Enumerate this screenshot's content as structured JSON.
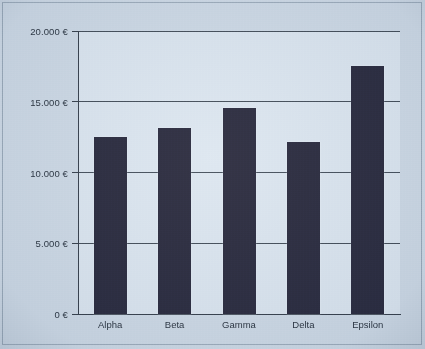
{
  "chart_data": {
    "type": "bar",
    "title": "",
    "xlabel": "",
    "ylabel": "",
    "categories": [
      "Alpha",
      "Beta",
      "Gamma",
      "Delta",
      "Epsilon"
    ],
    "values": [
      12500,
      13150,
      14550,
      12150,
      17550
    ],
    "ylim": [
      0,
      20000
    ],
    "ytick_values": [
      0,
      5000,
      10000,
      15000,
      20000
    ],
    "ytick_labels": [
      "0 €",
      "5.000 €",
      "10.000 €",
      "15.000 €",
      "20.000 €"
    ],
    "grid": true,
    "legend": false,
    "currency_symbol": "€",
    "number_format": "de-DE",
    "series": [
      {
        "name": "Betrag",
        "values": [
          12500,
          13150,
          14550,
          12150,
          17550
        ]
      }
    ],
    "colors": {
      "bar_fill": "#1e1e32",
      "plot_background": "#dbe5ef",
      "page_background": "#ccd8e4",
      "axis": "#2b3440",
      "gridline": "#3a4450",
      "text": "#1b2430"
    }
  }
}
